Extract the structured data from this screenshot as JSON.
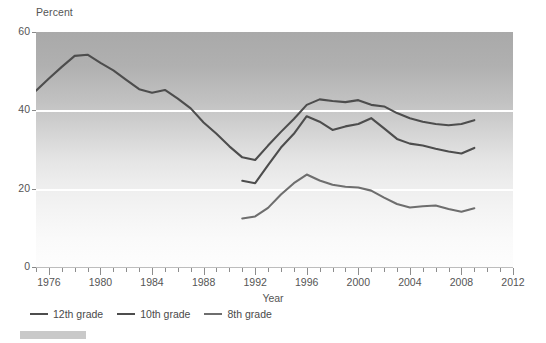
{
  "chart_data": {
    "type": "line",
    "title": "",
    "xlabel": "Year",
    "ylabel": "Percent",
    "ylim": [
      0,
      60
    ],
    "xlim": [
      1975,
      2012
    ],
    "yticks": [
      0,
      20,
      40,
      60
    ],
    "xticks": [
      1976,
      1980,
      1984,
      1988,
      1992,
      1996,
      2000,
      2004,
      2008,
      2012
    ],
    "grid": "horizontal-white-at-20-and-40",
    "legend_position": "below-axis-left",
    "series": [
      {
        "name": "12th grade",
        "color": "#4d4d4d",
        "x": [
          1975,
          1976,
          1977,
          1978,
          1979,
          1980,
          1981,
          1982,
          1983,
          1984,
          1985,
          1986,
          1987,
          1988,
          1989,
          1990,
          1991,
          1992,
          1993,
          1994,
          1995,
          1996,
          1997,
          1998,
          1999,
          2000,
          2001,
          2002,
          2003,
          2004,
          2005,
          2006,
          2007,
          2008,
          2009
        ],
        "values": [
          45.0,
          48.1,
          51.1,
          53.9,
          54.2,
          52.1,
          50.2,
          47.8,
          45.4,
          44.5,
          45.2,
          43.0,
          40.5,
          36.9,
          34.0,
          30.8,
          28.0,
          27.3,
          31.0,
          34.5,
          37.8,
          41.4,
          42.8,
          42.4,
          42.1,
          42.6,
          41.4,
          41.0,
          39.3,
          38.0,
          37.1,
          36.5,
          36.2,
          36.5,
          37.5
        ]
      },
      {
        "name": "10th grade",
        "color": "#4d4d4d",
        "x": [
          1991,
          1992,
          1993,
          1994,
          1995,
          1996,
          1997,
          1998,
          1999,
          2000,
          2001,
          2002,
          2003,
          2004,
          2005,
          2006,
          2007,
          2008,
          2009
        ],
        "values": [
          22.0,
          21.4,
          26.0,
          30.5,
          34.0,
          38.5,
          37.1,
          35.0,
          35.9,
          36.5,
          38.0,
          35.4,
          32.7,
          31.5,
          31.0,
          30.2,
          29.5,
          29.0,
          30.4
        ]
      },
      {
        "name": "8th grade",
        "color": "#6e6e6e",
        "x": [
          1991,
          1992,
          1993,
          1994,
          1995,
          1996,
          1997,
          1998,
          1999,
          2000,
          2001,
          2002,
          2003,
          2004,
          2005,
          2006,
          2007,
          2008,
          2009
        ],
        "values": [
          12.4,
          12.9,
          15.1,
          18.5,
          21.4,
          23.6,
          22.1,
          21.0,
          20.5,
          20.3,
          19.5,
          17.7,
          16.1,
          15.2,
          15.5,
          15.7,
          14.8,
          14.1,
          15.0
        ]
      }
    ]
  },
  "axes": {
    "y_title": "Percent",
    "x_title": "Year",
    "y_tick_labels": [
      "60",
      "40",
      "20",
      "0"
    ],
    "x_tick_labels": [
      "1976",
      "1980",
      "1984",
      "1988",
      "1992",
      "1996",
      "2000",
      "2004",
      "2008",
      "2012"
    ]
  },
  "legend": {
    "items": [
      {
        "label": "12th grade",
        "color": "#4d4d4d"
      },
      {
        "label": "10th grade",
        "color": "#4d4d4d"
      },
      {
        "label": "8th grade",
        "color": "#6e6e6e"
      }
    ]
  }
}
